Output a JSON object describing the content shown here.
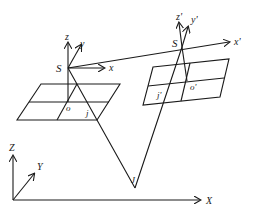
{
  "diagram": {
    "type": "stereo camera projection geometry",
    "left_camera": {
      "center_label": "S",
      "axes": {
        "x": "x",
        "y": "y",
        "z": "z"
      },
      "principal_point_label": "o",
      "image_point_label": "j"
    },
    "right_camera": {
      "center_label": "S",
      "axes": {
        "x": "x'",
        "y": "y'",
        "z": "z'"
      },
      "principal_point_label": "o'",
      "image_point_label": "j'"
    },
    "world_frame": {
      "axes": {
        "x": "X",
        "y": "Y",
        "z": "Z"
      }
    },
    "object_point_label": "J",
    "colors": {
      "stroke": "#1a1a1a",
      "background": "#ffffff"
    }
  }
}
